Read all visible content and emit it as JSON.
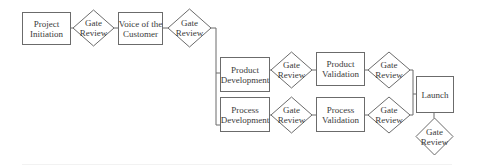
{
  "diagram": {
    "type": "flowchart",
    "colors": {
      "stroke": "#6b6b6b",
      "fill": "#ffffff",
      "text": "#3a3a3a"
    },
    "nodes": {
      "project_initiation": {
        "shape": "rect",
        "lines": [
          "Project",
          "Initiation"
        ]
      },
      "gate1": {
        "shape": "diamond",
        "lines": [
          "Gate",
          "Review"
        ]
      },
      "voice_of_customer": {
        "shape": "rect",
        "lines": [
          "Voice of the",
          "Customer"
        ]
      },
      "gate2": {
        "shape": "diamond",
        "lines": [
          "Gate",
          "Review"
        ]
      },
      "product_development": {
        "shape": "rect",
        "lines": [
          "Product",
          "Development"
        ]
      },
      "gate3": {
        "shape": "diamond",
        "lines": [
          "Gate",
          "Review"
        ]
      },
      "product_validation": {
        "shape": "rect",
        "lines": [
          "Product",
          "Validation"
        ]
      },
      "gate4": {
        "shape": "diamond",
        "lines": [
          "Gate",
          "Review"
        ]
      },
      "process_development": {
        "shape": "rect",
        "lines": [
          "Process",
          "Development"
        ]
      },
      "gate5": {
        "shape": "diamond",
        "lines": [
          "Gate",
          "Review"
        ]
      },
      "process_validation": {
        "shape": "rect",
        "lines": [
          "Process",
          "Validation"
        ]
      },
      "gate6": {
        "shape": "diamond",
        "lines": [
          "Gate",
          "Review"
        ]
      },
      "launch": {
        "shape": "rect",
        "lines": [
          "Launch"
        ]
      },
      "gate7": {
        "shape": "diamond",
        "lines": [
          "Gate",
          "Review"
        ]
      }
    },
    "edges": [
      {
        "from": "project_initiation",
        "to": "gate1"
      },
      {
        "from": "gate1",
        "to": "voice_of_customer"
      },
      {
        "from": "voice_of_customer",
        "to": "gate2"
      },
      {
        "from": "gate2",
        "to": "product_development"
      },
      {
        "from": "gate2",
        "to": "process_development"
      },
      {
        "from": "product_development",
        "to": "gate3"
      },
      {
        "from": "gate3",
        "to": "product_validation"
      },
      {
        "from": "product_validation",
        "to": "gate4"
      },
      {
        "from": "process_development",
        "to": "gate5"
      },
      {
        "from": "gate5",
        "to": "process_validation"
      },
      {
        "from": "process_validation",
        "to": "gate6"
      },
      {
        "from": "gate4",
        "to": "launch"
      },
      {
        "from": "gate6",
        "to": "launch"
      },
      {
        "from": "launch",
        "to": "gate7"
      }
    ]
  }
}
